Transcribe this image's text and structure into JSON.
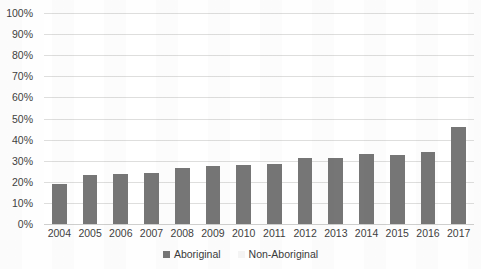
{
  "chart_data": {
    "type": "bar",
    "title": "",
    "xlabel": "",
    "ylabel": "",
    "ylim": [
      0,
      100
    ],
    "ytick_labels": [
      "100%",
      "90%",
      "80%",
      "70%",
      "60%",
      "50%",
      "40%",
      "30%",
      "20%",
      "10%",
      "0%"
    ],
    "ytick_values": [
      100,
      90,
      80,
      70,
      60,
      50,
      40,
      30,
      20,
      10,
      0
    ],
    "grid": true,
    "legend_position": "bottom",
    "categories": [
      "2004",
      "2005",
      "2006",
      "2007",
      "2008",
      "2009",
      "2010",
      "2011",
      "2012",
      "2013",
      "2014",
      "2015",
      "2016",
      "2017"
    ],
    "series": [
      {
        "name": "Aboriginal",
        "color": "#767676",
        "values": [
          19,
          23,
          23.5,
          24,
          26.5,
          27.5,
          28,
          28.5,
          31.5,
          31.5,
          33,
          32.5,
          34,
          46
        ]
      },
      {
        "name": "Non-Aboriginal",
        "color": "#f4f4f4",
        "values": [
          0,
          0,
          0,
          0,
          0,
          0,
          0,
          0,
          0,
          0,
          0,
          0,
          0,
          0
        ]
      }
    ]
  },
  "legend": {
    "items": [
      {
        "label": "Aboriginal"
      },
      {
        "label": "Non-Aboriginal"
      }
    ]
  }
}
